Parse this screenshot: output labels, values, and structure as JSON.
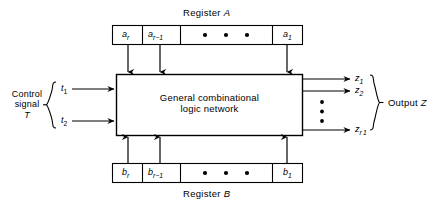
{
  "figure": {
    "background": "#ffffff",
    "ink": "#000000"
  },
  "register_a": {
    "caption": "Register",
    "caption_italic": "A",
    "cells": [
      {
        "base": "a",
        "sub": "r"
      },
      {
        "base": "a",
        "sub": "r−1"
      },
      {
        "base": "",
        "sub": "",
        "dots": true
      },
      {
        "base": "a",
        "sub": "1"
      }
    ],
    "dots_count": 3
  },
  "register_b": {
    "caption": "Register",
    "caption_italic": "B",
    "cells": [
      {
        "base": "b",
        "sub": "r"
      },
      {
        "base": "b",
        "sub": "r−1"
      },
      {
        "base": "",
        "sub": "",
        "dots": true
      },
      {
        "base": "b",
        "sub": "1"
      }
    ],
    "dots_count": 3
  },
  "main_block": {
    "line1": "General  combinational",
    "line2": "logic  network"
  },
  "control": {
    "caption_line1": "Control",
    "caption_line2": "signal",
    "caption_line3": "T",
    "signals": [
      {
        "base": "t",
        "sub": "1"
      },
      {
        "base": "t",
        "sub": "2"
      }
    ]
  },
  "output": {
    "caption": "Output",
    "caption_italic": "Z",
    "signals": [
      {
        "base": "z",
        "sub": "1"
      },
      {
        "base": "z",
        "sub": "2"
      },
      {
        "base": "z",
        "sub": "r 1"
      }
    ],
    "vertical_dots": 3
  }
}
